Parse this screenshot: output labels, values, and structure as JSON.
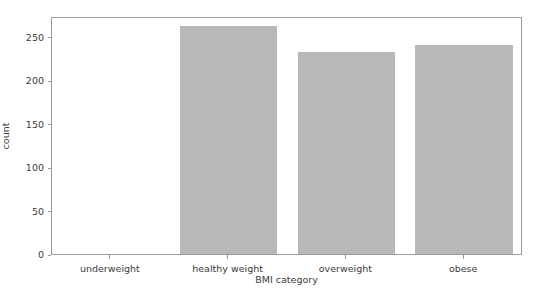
{
  "chart_data": {
    "type": "bar",
    "title": "",
    "xlabel": "BMI category",
    "ylabel": "count",
    "categories": [
      "underweight",
      "healthy weight",
      "overweight",
      "obese"
    ],
    "values": [
      0,
      263,
      232,
      241
    ],
    "ylim": [
      0,
      274
    ],
    "yticks": [
      0,
      50,
      100,
      150,
      200,
      250
    ],
    "ytick_labels": [
      "0",
      "50",
      "100",
      "150",
      "200",
      "250"
    ],
    "grid": false,
    "legend": null,
    "bar_color": "#b9b9b9",
    "axes_color": "#9a9a9a",
    "text_color": "#3b3b3b",
    "background": "#ffffff"
  }
}
